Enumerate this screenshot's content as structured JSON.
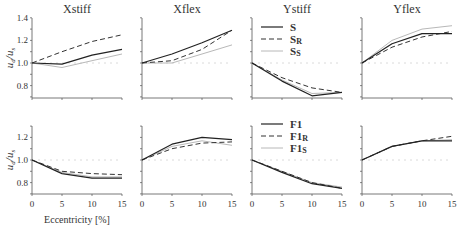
{
  "figure": {
    "y_axis_label": "u_d / u_s",
    "x_axis_label": "Eccentricity [%]",
    "colors": {
      "solid": "#222222",
      "dashed": "#333333",
      "dotted": "#b8b8b8",
      "axis": "#555555",
      "reference": "#d0d0d0"
    }
  },
  "legends": {
    "top": [
      {
        "label": "S",
        "sub": "",
        "style": "solid"
      },
      {
        "label": "S",
        "sub": "R",
        "style": "dashed"
      },
      {
        "label": "S",
        "sub": "S",
        "style": "dotted"
      }
    ],
    "bottom": [
      {
        "label": "F1",
        "sub": "",
        "style": "solid"
      },
      {
        "label": "F1",
        "sub": "R",
        "style": "dashed"
      },
      {
        "label": "F1",
        "sub": "S",
        "style": "dotted"
      }
    ]
  },
  "chart_data": [
    {
      "type": "line",
      "title": "Xstiff",
      "row": "top",
      "xlabel": "",
      "ylabel": "u_d/u_s",
      "x": [
        0,
        5,
        10,
        15
      ],
      "ylim": [
        0.7,
        1.4
      ],
      "yticks": [
        0.8,
        1.0,
        1.2,
        1.4
      ],
      "series": [
        {
          "name": "S",
          "style": "solid",
          "values": [
            1.0,
            0.99,
            1.07,
            1.12
          ]
        },
        {
          "name": "S_R",
          "style": "dashed",
          "values": [
            1.0,
            1.1,
            1.19,
            1.25
          ]
        },
        {
          "name": "S_S",
          "style": "dotted",
          "values": [
            1.0,
            0.96,
            1.02,
            1.08
          ]
        }
      ]
    },
    {
      "type": "line",
      "title": "Xflex",
      "row": "top",
      "xlabel": "",
      "ylabel": "",
      "x": [
        0,
        5,
        10,
        15
      ],
      "ylim": [
        0.7,
        1.4
      ],
      "yticks": [
        0.8,
        1.0,
        1.2,
        1.4
      ],
      "series": [
        {
          "name": "S",
          "style": "solid",
          "values": [
            1.0,
            1.08,
            1.18,
            1.29
          ]
        },
        {
          "name": "S_R",
          "style": "dashed",
          "values": [
            1.0,
            1.02,
            1.12,
            1.29
          ]
        },
        {
          "name": "S_S",
          "style": "dotted",
          "values": [
            1.0,
            1.0,
            1.08,
            1.16
          ]
        }
      ]
    },
    {
      "type": "line",
      "title": "Ystiff",
      "row": "top",
      "xlabel": "",
      "ylabel": "",
      "x": [
        0,
        5,
        10,
        15
      ],
      "ylim": [
        0.7,
        1.4
      ],
      "yticks": [
        0.8,
        1.0,
        1.2,
        1.4
      ],
      "series": [
        {
          "name": "S",
          "style": "solid",
          "values": [
            1.0,
            0.84,
            0.71,
            0.74
          ]
        },
        {
          "name": "S_R",
          "style": "dashed",
          "values": [
            1.0,
            0.87,
            0.78,
            0.74
          ]
        },
        {
          "name": "S_S",
          "style": "dotted",
          "values": [
            1.0,
            0.85,
            0.73,
            0.74
          ]
        }
      ]
    },
    {
      "type": "line",
      "title": "Yflex",
      "row": "top",
      "xlabel": "",
      "ylabel": "",
      "x": [
        0,
        5,
        10,
        15
      ],
      "ylim": [
        0.7,
        1.4
      ],
      "yticks": [
        0.8,
        1.0,
        1.2,
        1.4
      ],
      "series": [
        {
          "name": "S",
          "style": "solid",
          "values": [
            1.0,
            1.17,
            1.26,
            1.26
          ]
        },
        {
          "name": "S_R",
          "style": "dashed",
          "values": [
            1.0,
            1.14,
            1.23,
            1.28
          ]
        },
        {
          "name": "S_S",
          "style": "dotted",
          "values": [
            1.0,
            1.2,
            1.3,
            1.33
          ]
        }
      ]
    },
    {
      "type": "line",
      "title": "",
      "row": "bottom",
      "xlabel": "Eccentricity [%]",
      "ylabel": "u_d/u_s",
      "x": [
        0,
        5,
        10,
        15
      ],
      "ylim": [
        0.7,
        1.3
      ],
      "yticks": [
        0.8,
        1.0,
        1.2
      ],
      "series": [
        {
          "name": "F1",
          "style": "solid",
          "values": [
            1.0,
            0.88,
            0.84,
            0.84
          ]
        },
        {
          "name": "F1_R",
          "style": "dashed",
          "values": [
            1.0,
            0.9,
            0.88,
            0.87
          ]
        },
        {
          "name": "F1_S",
          "style": "dotted",
          "values": [
            1.0,
            0.89,
            0.85,
            0.85
          ]
        }
      ]
    },
    {
      "type": "line",
      "title": "",
      "row": "bottom",
      "xlabel": "",
      "ylabel": "",
      "x": [
        0,
        5,
        10,
        15
      ],
      "ylim": [
        0.7,
        1.3
      ],
      "yticks": [
        0.8,
        1.0,
        1.2
      ],
      "series": [
        {
          "name": "F1",
          "style": "solid",
          "values": [
            1.0,
            1.14,
            1.2,
            1.18
          ]
        },
        {
          "name": "F1_R",
          "style": "dashed",
          "values": [
            1.0,
            1.1,
            1.15,
            1.16
          ]
        },
        {
          "name": "F1_S",
          "style": "dotted",
          "values": [
            1.0,
            1.12,
            1.17,
            1.13
          ]
        }
      ]
    },
    {
      "type": "line",
      "title": "",
      "row": "bottom",
      "xlabel": "",
      "ylabel": "",
      "x": [
        0,
        5,
        10,
        15
      ],
      "ylim": [
        0.7,
        1.3
      ],
      "yticks": [
        0.8,
        1.0,
        1.2
      ],
      "series": [
        {
          "name": "F1",
          "style": "solid",
          "values": [
            1.0,
            0.89,
            0.79,
            0.75
          ]
        },
        {
          "name": "F1_R",
          "style": "dashed",
          "values": [
            1.0,
            0.9,
            0.8,
            0.75
          ]
        },
        {
          "name": "F1_S",
          "style": "dotted",
          "values": [
            1.0,
            0.9,
            0.8,
            0.76
          ]
        }
      ]
    },
    {
      "type": "line",
      "title": "",
      "row": "bottom",
      "xlabel": "",
      "ylabel": "",
      "x": [
        0,
        5,
        10,
        15
      ],
      "ylim": [
        0.7,
        1.3
      ],
      "yticks": [
        0.8,
        1.0,
        1.2
      ],
      "series": [
        {
          "name": "F1",
          "style": "solid",
          "values": [
            1.0,
            1.12,
            1.17,
            1.17
          ]
        },
        {
          "name": "F1_R",
          "style": "dashed",
          "values": [
            1.0,
            1.12,
            1.17,
            1.21
          ]
        },
        {
          "name": "F1_S",
          "style": "dotted",
          "values": [
            1.0,
            1.12,
            1.17,
            1.18
          ]
        }
      ]
    }
  ]
}
